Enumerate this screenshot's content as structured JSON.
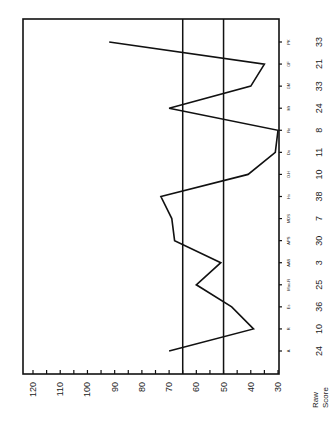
{
  "chart_data": {
    "type": "line",
    "orientation": "rotated-90-ccw",
    "title": "",
    "xlabel": "",
    "ylabel": "",
    "categories": [
      "A",
      "R",
      "Es",
      "Mac-R",
      "AAS",
      "APS",
      "MDS",
      "Hs",
      "O-H",
      "Do",
      "Re",
      "Mt",
      "GM",
      "GF",
      "PK"
    ],
    "raw_score_label": "Raw Score",
    "raw_scores": [
      24,
      10,
      36,
      25,
      3,
      30,
      7,
      38,
      10,
      11,
      8,
      24,
      33,
      21,
      33
    ],
    "series": [
      {
        "name": "T-score",
        "values": [
          70,
          39,
          47,
          60,
          51,
          68,
          69,
          73,
          41,
          31,
          30,
          70,
          40,
          35,
          92
        ]
      }
    ],
    "reference_lines": [
      65,
      50
    ],
    "ylim": [
      30,
      120
    ],
    "yticks": [
      120,
      110,
      100,
      90,
      80,
      70,
      60,
      50,
      40,
      30
    ],
    "minor_tick_step": 5,
    "grid": false,
    "legend": "none"
  },
  "labels": {
    "raw_line1": "Raw",
    "raw_line2": "Score"
  }
}
